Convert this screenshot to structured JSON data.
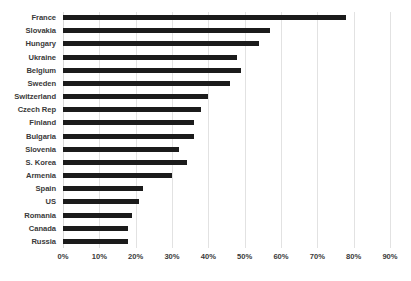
{
  "chart_data": {
    "type": "bar",
    "orientation": "horizontal",
    "title": "",
    "xlabel": "",
    "ylabel": "",
    "xlim": [
      0,
      90
    ],
    "xticks": [
      "0%",
      "10%",
      "20%",
      "30%",
      "40%",
      "50%",
      "60%",
      "70%",
      "80%",
      "90%"
    ],
    "xtick_values": [
      0,
      10,
      20,
      30,
      40,
      50,
      60,
      70,
      80,
      90
    ],
    "grid": "vertical",
    "legend": "none",
    "bar_color": "#1b1b1b",
    "gridline_color": "#e2e2e2",
    "categories": [
      "France",
      "Slovakia",
      "Hungary",
      "Ukraine",
      "Belgium",
      "Sweden",
      "Switzerland",
      "Czech Rep",
      "Finland",
      "Bulgaria",
      "Slovenia",
      "S. Korea",
      "Armenia",
      "Spain",
      "US",
      "Romania",
      "Canada",
      "Russia"
    ],
    "values": [
      78,
      57,
      54,
      48,
      49,
      46,
      40,
      38,
      36,
      36,
      32,
      34,
      30,
      22,
      21,
      19,
      18,
      18
    ]
  }
}
